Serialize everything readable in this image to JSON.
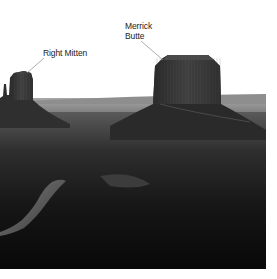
{
  "image": {
    "description": "Grayscale photograph of Monument Valley landscape with two annotated landforms",
    "palette": {
      "sky": "#ffffff",
      "horizon": "#9a9a9a",
      "mesa": "#3a3a3a",
      "ground": "#1a1a1a",
      "road": "#6a6a6a",
      "leader_line": "#888888"
    }
  },
  "annotations": [
    {
      "id": "right-mitten",
      "lines": [
        "Right Mitten"
      ]
    },
    {
      "id": "merrick-butte",
      "lines": [
        "Merrick",
        "Butte"
      ]
    }
  ]
}
